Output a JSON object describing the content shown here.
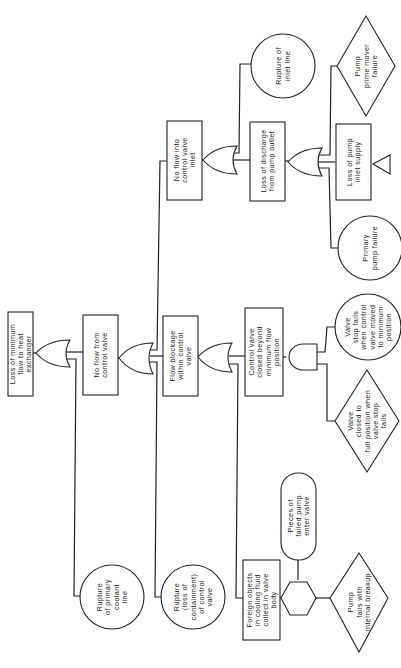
{
  "diagram": {
    "type": "fault-tree",
    "orientation": "rotated-counterclockwise",
    "top_event": {
      "id": "top",
      "shape": "rectangle",
      "lines": [
        "Loss of minimum",
        "flow to heat",
        "exchanger"
      ]
    },
    "nodes": {
      "no_flow_cv": {
        "shape": "rectangle",
        "lines": [
          "No flow from",
          "control valve"
        ]
      },
      "rupture_coolant": {
        "shape": "circle",
        "lines": [
          "Rupture",
          "of primary",
          "coolant",
          "line"
        ]
      },
      "no_flow_inlet": {
        "shape": "rectangle",
        "lines": [
          "No flow into",
          "control valve",
          "inlet"
        ]
      },
      "flow_blockage": {
        "shape": "rectangle",
        "lines": [
          "Flow blockage",
          "within control",
          "valve"
        ]
      },
      "rupture_cv": {
        "shape": "circle",
        "lines": [
          "Rupture",
          "(loss of",
          "containment)",
          "of control",
          "valve"
        ]
      },
      "rupture_inlet": {
        "shape": "circle",
        "lines": [
          "Rupture of",
          "inlet line"
        ]
      },
      "loss_discharge": {
        "shape": "rectangle",
        "lines": [
          "Loss of discharge",
          "from pump outlet"
        ]
      },
      "prime_mover": {
        "shape": "diamond",
        "lines": [
          "Pump",
          "prime mover",
          "failure"
        ]
      },
      "loss_inlet_supply": {
        "shape": "rectangle",
        "lines": [
          "Loss of pump",
          "inlet supply"
        ]
      },
      "primary_pump": {
        "shape": "circle",
        "lines": [
          "Primary",
          "pump failure"
        ]
      },
      "cv_closed": {
        "shape": "rectangle",
        "lines": [
          "Control valve",
          "closed beyond",
          "minimum flow",
          "position"
        ]
      },
      "valve_stop_fails": {
        "shape": "circle",
        "lines": [
          "Valve",
          "stop fails",
          "when control",
          "valve moved",
          "to minimum",
          "position"
        ]
      },
      "valve_closed_full": {
        "shape": "diamond",
        "lines": [
          "Valve",
          "closed to",
          "full position when",
          "valve stop",
          "fails"
        ]
      },
      "foreign_objects": {
        "shape": "rectangle",
        "lines": [
          "Foreign objects",
          "in cooling fluid",
          "collect in valve",
          "body"
        ]
      },
      "pieces_pump": {
        "shape": "stadium",
        "lines": [
          "Pieces of",
          "failed pump",
          "enter valve"
        ]
      },
      "pump_breakup": {
        "shape": "diamond",
        "lines": [
          "Pump",
          "fails with",
          "internal breakup"
        ]
      }
    },
    "gates": [
      {
        "id": "g1",
        "type": "OR",
        "output": "top",
        "inputs": [
          "no_flow_cv",
          "rupture_coolant"
        ]
      },
      {
        "id": "g2",
        "type": "OR",
        "output": "no_flow_cv",
        "inputs": [
          "no_flow_inlet",
          "flow_blockage",
          "rupture_cv"
        ]
      },
      {
        "id": "g3",
        "type": "OR",
        "output": "no_flow_inlet",
        "inputs": [
          "rupture_inlet",
          "loss_discharge"
        ]
      },
      {
        "id": "g4",
        "type": "OR",
        "output": "loss_discharge",
        "inputs": [
          "prime_mover",
          "loss_inlet_supply",
          "primary_pump"
        ]
      },
      {
        "id": "g5",
        "type": "OR",
        "output": "flow_blockage",
        "inputs": [
          "cv_closed",
          "foreign_objects"
        ]
      },
      {
        "id": "g6",
        "type": "AND",
        "output": "cv_closed",
        "inputs": [
          "valve_stop_fails",
          "valve_closed_full"
        ]
      },
      {
        "id": "g7",
        "type": "INHIBIT",
        "output": "foreign_objects",
        "inputs": [
          "pump_breakup"
        ],
        "condition": "pieces_pump"
      }
    ],
    "transfer_symbols": [
      {
        "attached_to": "loss_inlet_supply",
        "shape": "triangle"
      }
    ]
  }
}
